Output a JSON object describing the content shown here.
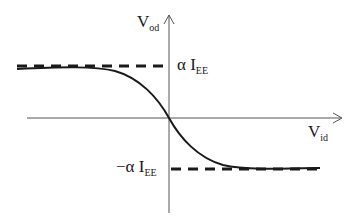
{
  "diagram": {
    "axes": {
      "y_label": {
        "main": "V",
        "sub": "od"
      },
      "x_label": {
        "main": "V",
        "sub": "id"
      }
    },
    "levels": {
      "upper": {
        "prefix": "α I",
        "sub": "EE"
      },
      "lower": {
        "prefix": "−α I",
        "sub": "EE"
      }
    },
    "colors": {
      "axis": "#555555",
      "curve": "#1a1a1a",
      "dashed": "#1a1a1a",
      "background": "#ffffff"
    }
  }
}
